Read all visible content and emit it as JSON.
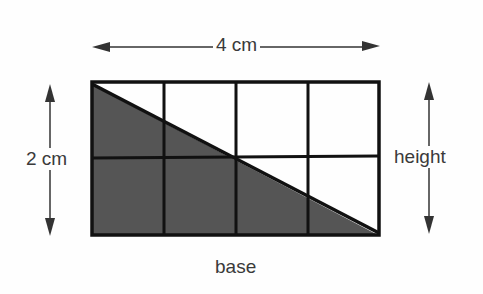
{
  "diagram": {
    "title": "",
    "labels": {
      "width": "4 cm",
      "height_left": "2 cm",
      "height_right": "height",
      "base": "base"
    },
    "grid": {
      "columns": 4,
      "rows": 2
    },
    "shaded_region": "lower-left triangle below diagonal from top-left to bottom-right",
    "colors": {
      "shade": "#555555",
      "stroke": "#111111",
      "background": "#fefefe",
      "text": "#3a3a3a"
    }
  }
}
